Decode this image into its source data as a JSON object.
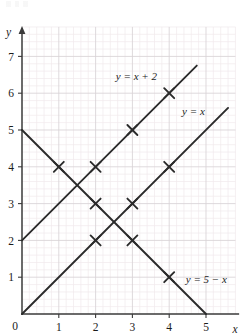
{
  "figure": {
    "background_color": "#ffffff",
    "width": 242,
    "height": 336
  },
  "chart_data": {
    "type": "line",
    "title": "",
    "subtitle": "",
    "xlabel": "x",
    "ylabel": "y",
    "xlim": [
      0,
      5.8
    ],
    "ylim": [
      0,
      7.8
    ],
    "x_ticks": [
      0,
      1,
      2,
      3,
      4,
      5
    ],
    "y_ticks": [
      0,
      1,
      2,
      3,
      4,
      5,
      6,
      7
    ],
    "x_tick_labels": [
      "0",
      "1",
      "2",
      "3",
      "4",
      "5"
    ],
    "y_tick_labels": [
      "0",
      "1",
      "2",
      "3",
      "4",
      "5",
      "6",
      "7"
    ],
    "grid": true,
    "grid_major_color": "#d8d2d6",
    "grid_minor_color": "#f0e9ec",
    "grid_minor_divisions": 5,
    "axis_color": "#3a3a3a",
    "legend_position": "inline-at-line-end",
    "series": [
      {
        "name": "y = x + 2",
        "label": "y = x + 2",
        "equation": "y = x + 2",
        "color": "#2b2b2b",
        "marker": "x-cross",
        "line_start": [
          0,
          2
        ],
        "line_end": [
          4.75,
          6.75
        ],
        "points": [
          {
            "x": 2,
            "y": 4
          },
          {
            "x": 3,
            "y": 5
          },
          {
            "x": 4,
            "y": 6
          }
        ],
        "label_position": {
          "x": 2.55,
          "y": 6.35
        }
      },
      {
        "name": "y = x",
        "label": "y = x",
        "equation": "y = x",
        "color": "#2b2b2b",
        "marker": "x-cross",
        "line_start": [
          0,
          0
        ],
        "line_end": [
          5.6,
          5.6
        ],
        "points": [
          {
            "x": 2,
            "y": 2
          },
          {
            "x": 3,
            "y": 3
          },
          {
            "x": 4,
            "y": 4
          }
        ],
        "label_position": {
          "x": 4.35,
          "y": 5.4
        }
      },
      {
        "name": "y = 5 - x",
        "label": "y = 5 − x",
        "equation": "y = 5 − x",
        "color": "#2b2b2b",
        "marker": "x-cross",
        "line_start": [
          0,
          5
        ],
        "line_end": [
          5,
          0
        ],
        "points": [
          {
            "x": 1,
            "y": 4
          },
          {
            "x": 2,
            "y": 3
          },
          {
            "x": 3,
            "y": 2
          },
          {
            "x": 4,
            "y": 1
          }
        ],
        "label_position": {
          "x": 4.45,
          "y": 0.85
        }
      }
    ],
    "annotations": [
      {
        "text": "y",
        "role": "y-axis-name",
        "x": -0.35,
        "y": 7.6
      },
      {
        "text": "x",
        "role": "x-axis-name",
        "x": 5.72,
        "y": -0.42
      }
    ]
  }
}
